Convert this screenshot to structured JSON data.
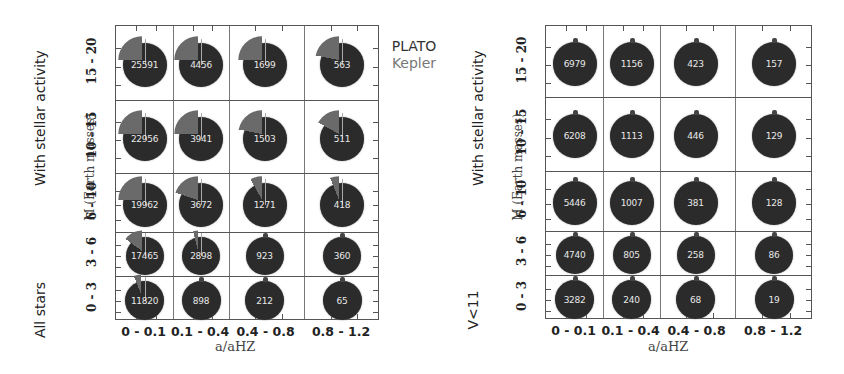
{
  "legend": {
    "items": [
      {
        "label": "PLATO",
        "color": "#2b2b2b"
      },
      {
        "label": "Kepler",
        "color": "#6a6a6a"
      }
    ]
  },
  "left_panel": {
    "row_group_top_label": "With stellar activity",
    "row_group_bottom_label": "All stars",
    "ylabel": "M (Earth masses)",
    "xlabel": "a/aHZ"
  },
  "right_panel": {
    "row_group_top_label": "With stellar activity",
    "row_group_bottom_label": "V<11",
    "ylabel": "M (Earth masses)",
    "xlabel": "a/aHZ"
  },
  "chart_data": [
    {
      "type": "pie",
      "title": "All stars",
      "xlabel": "a/aHZ",
      "ylabel": "M (Earth masses)",
      "categories_x": [
        "0 - 0.1",
        "0.1 - 0.4",
        "0.4 - 0.8",
        "0.8 - 1.2"
      ],
      "categories_y": [
        "15 - 20",
        "10 - 15",
        "6 - 10",
        "3 - 6",
        "0 - 3"
      ],
      "legend": [
        "PLATO",
        "Kepler"
      ],
      "cells": [
        [
          25591,
          4456,
          1699,
          563
        ],
        [
          22956,
          3941,
          1503,
          511
        ],
        [
          19962,
          3672,
          1271,
          418
        ],
        [
          17465,
          2898,
          923,
          360
        ],
        [
          11820,
          898,
          212,
          65
        ]
      ],
      "kepler_fraction_approx": [
        [
          0.25,
          0.25,
          0.25,
          0.22
        ],
        [
          0.25,
          0.25,
          0.22,
          0.17
        ],
        [
          0.25,
          0.2,
          0.08,
          0.06
        ],
        [
          0.15,
          0.04,
          0.02,
          0.0
        ],
        [
          0.06,
          0.0,
          0.0,
          0.0
        ]
      ],
      "grid": true,
      "sublabels": {
        "top": "With stellar activity",
        "bottom": "All stars"
      }
    },
    {
      "type": "pie",
      "title": "V<11",
      "xlabel": "a/aHZ",
      "ylabel": "M (Earth masses)",
      "categories_x": [
        "0 - 0.1",
        "0.1 - 0.4",
        "0.4 - 0.8",
        "0.8 - 1.2"
      ],
      "categories_y": [
        "15 - 20",
        "10 - 15",
        "6 - 10",
        "3 - 6",
        "0 - 3"
      ],
      "legend": [
        "PLATO",
        "Kepler"
      ],
      "cells": [
        [
          6979,
          1156,
          423,
          157
        ],
        [
          6208,
          1113,
          446,
          129
        ],
        [
          5446,
          1007,
          381,
          128
        ],
        [
          4740,
          805,
          258,
          86
        ],
        [
          3282,
          240,
          68,
          19
        ]
      ],
      "kepler_fraction_approx": [
        [
          0.02,
          0.02,
          0.02,
          0.02
        ],
        [
          0.02,
          0.02,
          0.02,
          0.02
        ],
        [
          0.02,
          0.02,
          0.02,
          0.01
        ],
        [
          0.01,
          0.0,
          0.0,
          0.0
        ],
        [
          0.0,
          0.0,
          0.0,
          0.0
        ]
      ],
      "grid": true,
      "sublabels": {
        "top": "With stellar activity",
        "bottom": "V<11"
      }
    }
  ]
}
